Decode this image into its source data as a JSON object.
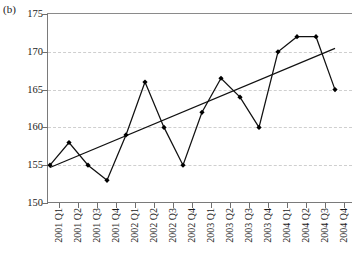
{
  "panel_label": "(b)",
  "chart_data": {
    "type": "line",
    "title": "",
    "xlabel": "",
    "ylabel": "",
    "categories": [
      "2001 Q1",
      "2001 Q2",
      "2001 Q3",
      "2001 Q4",
      "2002 Q1",
      "2002 Q2",
      "2002 Q3",
      "2002 Q4",
      "2003 Q1",
      "2003 Q2",
      "2003 Q3",
      "2003 Q4",
      "2004 Q1",
      "2004 Q2",
      "2004 Q3",
      "2004 Q4"
    ],
    "series": [
      {
        "name": "series",
        "marker": "filled-diamond",
        "color": "#000000",
        "values": [
          155,
          158,
          155,
          153,
          159,
          166,
          160,
          155,
          162,
          166.5,
          164,
          160,
          170,
          172,
          172,
          165
        ]
      },
      {
        "name": "linear-trend",
        "marker": "none",
        "color": "#000000",
        "values": [
          154.7,
          155.75,
          156.8,
          157.85,
          158.9,
          159.95,
          161.0,
          162.05,
          163.1,
          164.15,
          165.2,
          166.25,
          167.3,
          168.35,
          169.4,
          170.45
        ]
      }
    ],
    "ylim": [
      150,
      175
    ],
    "yticks": [
      150,
      155,
      160,
      165,
      170,
      175
    ],
    "ytick_labels": [
      "150",
      "155",
      "160",
      "165",
      "170",
      "175"
    ],
    "grid": true,
    "grid_style": "dashed",
    "grid_color": "#cfcfcf",
    "legend": "none",
    "axis_color": "#7a7a7a"
  }
}
